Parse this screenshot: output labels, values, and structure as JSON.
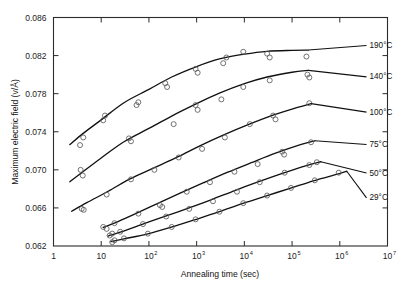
{
  "chart_data": {
    "type": "line",
    "title": "",
    "xlabel": "Annealing time (sec)",
    "ylabel": "Maximum electric field (v/Å)",
    "xscale": "log",
    "xlim": [
      1,
      10000000
    ],
    "ylim": [
      0.062,
      0.086
    ],
    "xticks": [
      1,
      10,
      100,
      1000,
      10000,
      100000,
      1000000,
      10000000
    ],
    "xtick_labels": [
      "1",
      "10",
      "10²",
      "10³",
      "10⁴",
      "10⁵",
      "10⁶",
      "10⁷"
    ],
    "xtick_mantissa": [
      "1",
      "10",
      "10",
      "10",
      "10",
      "10",
      "10",
      "10"
    ],
    "xtick_exponent": [
      "",
      "",
      "2",
      "3",
      "4",
      "5",
      "6",
      "7"
    ],
    "yticks": [
      0.062,
      0.066,
      0.07,
      0.074,
      0.078,
      0.082,
      0.086
    ],
    "ytick_labels": [
      "0.062",
      "0.066",
      "0.070",
      "0.074",
      "0.078",
      "0.082",
      "0.086"
    ],
    "grid": false,
    "legend_position": "inline-right-of-curve-ends",
    "marker": "open-circle",
    "line_color": "#111111",
    "marker_color": "#5a5a5a",
    "series": [
      {
        "name": "190°C",
        "label": "190°C",
        "label_x": 4000000,
        "label_y": 0.0828,
        "curve": [
          [
            2.2,
            0.07265
          ],
          [
            4.0,
            0.07375
          ],
          [
            10,
            0.07525
          ],
          [
            30,
            0.07705
          ],
          [
            100,
            0.07845
          ],
          [
            300,
            0.07975
          ],
          [
            1000,
            0.08085
          ],
          [
            3000,
            0.08165
          ],
          [
            10000,
            0.08215
          ],
          [
            30000,
            0.08245
          ],
          [
            100000,
            0.08255
          ],
          [
            220000,
            0.08258
          ]
        ],
        "points": [
          [
            3.6,
            0.0726
          ],
          [
            4.2,
            0.0734
          ],
          [
            11,
            0.0752
          ],
          [
            12,
            0.0757
          ],
          [
            55,
            0.0768
          ],
          [
            60,
            0.0771
          ],
          [
            220,
            0.0791
          ],
          [
            240,
            0.0787
          ],
          [
            950,
            0.0806
          ],
          [
            1050,
            0.0802
          ],
          [
            3600,
            0.0812
          ],
          [
            4200,
            0.0818
          ],
          [
            9500,
            0.0824
          ],
          [
            30000,
            0.0822
          ],
          [
            34000,
            0.0818
          ],
          [
            200000,
            0.0819
          ]
        ]
      },
      {
        "name": "140°C",
        "label": "140°C",
        "label_x": 4000000,
        "label_y": 0.0795,
        "curve": [
          [
            2.2,
            0.06875
          ],
          [
            4.0,
            0.06975
          ],
          [
            10,
            0.07125
          ],
          [
            30,
            0.07295
          ],
          [
            100,
            0.07435
          ],
          [
            300,
            0.07565
          ],
          [
            1000,
            0.07695
          ],
          [
            3000,
            0.07805
          ],
          [
            10000,
            0.07905
          ],
          [
            30000,
            0.07975
          ],
          [
            100000,
            0.08025
          ],
          [
            220000,
            0.08045
          ]
        ],
        "points": [
          [
            3.7,
            0.07
          ],
          [
            4.1,
            0.0694
          ],
          [
            38,
            0.0733
          ],
          [
            42,
            0.073
          ],
          [
            330,
            0.0748
          ],
          [
            950,
            0.0768
          ],
          [
            1050,
            0.0763
          ],
          [
            3300,
            0.0774
          ],
          [
            9500,
            0.0787
          ],
          [
            34000,
            0.0794
          ],
          [
            210000,
            0.08
          ],
          [
            230000,
            0.0797
          ]
        ]
      },
      {
        "name": "100°C",
        "label": "100°C",
        "label_x": 4000000,
        "label_y": 0.0758,
        "curve": [
          [
            2.4,
            0.06565
          ],
          [
            5.0,
            0.06655
          ],
          [
            14,
            0.06775
          ],
          [
            40,
            0.06905
          ],
          [
            120,
            0.07015
          ],
          [
            400,
            0.07135
          ],
          [
            1200,
            0.07255
          ],
          [
            3600,
            0.07365
          ],
          [
            12000,
            0.07475
          ],
          [
            40000,
            0.07575
          ],
          [
            130000,
            0.07655
          ],
          [
            250000,
            0.07695
          ]
        ],
        "points": [
          [
            3.9,
            0.0659
          ],
          [
            4.3,
            0.0658
          ],
          [
            13,
            0.0674
          ],
          [
            42,
            0.069
          ],
          [
            130,
            0.07
          ],
          [
            420,
            0.0713
          ],
          [
            1300,
            0.0722
          ],
          [
            3900,
            0.0734
          ],
          [
            13000,
            0.0748
          ],
          [
            40000,
            0.0757
          ],
          [
            45000,
            0.0753
          ],
          [
            230000,
            0.077
          ]
        ]
      },
      {
        "name": "75°C",
        "label": "75°C",
        "label_x": 4000000,
        "label_y": 0.0724,
        "curve": [
          [
            11,
            0.06395
          ],
          [
            20,
            0.06445
          ],
          [
            50,
            0.06535
          ],
          [
            150,
            0.06645
          ],
          [
            450,
            0.06755
          ],
          [
            1400,
            0.06865
          ],
          [
            4500,
            0.06975
          ],
          [
            14000,
            0.07075
          ],
          [
            45000,
            0.07175
          ],
          [
            150000,
            0.07265
          ],
          [
            300000,
            0.07305
          ]
        ],
        "points": [
          [
            11,
            0.064
          ],
          [
            13,
            0.0638
          ],
          [
            19,
            0.0644
          ],
          [
            60,
            0.0654
          ],
          [
            170,
            0.0663
          ],
          [
            190,
            0.0661
          ],
          [
            620,
            0.0677
          ],
          [
            1900,
            0.0687
          ],
          [
            6200,
            0.0698
          ],
          [
            19000,
            0.0706
          ],
          [
            62000,
            0.0719
          ],
          [
            68000,
            0.0716
          ],
          [
            250000,
            0.0729
          ]
        ]
      },
      {
        "name": "50°C",
        "label": "50°C",
        "label_x": 4000000,
        "label_y": 0.0694,
        "curve": [
          [
            14,
            0.06305
          ],
          [
            25,
            0.06345
          ],
          [
            70,
            0.06425
          ],
          [
            200,
            0.06505
          ],
          [
            650,
            0.06595
          ],
          [
            2000,
            0.06685
          ],
          [
            6500,
            0.06785
          ],
          [
            20000,
            0.06875
          ],
          [
            65000,
            0.06965
          ],
          [
            200000,
            0.07045
          ],
          [
            400000,
            0.07085
          ]
        ],
        "points": [
          [
            15,
            0.0631
          ],
          [
            17,
            0.0633
          ],
          [
            25,
            0.0635
          ],
          [
            75,
            0.0643
          ],
          [
            230,
            0.0651
          ],
          [
            700,
            0.0659
          ],
          [
            2200,
            0.0667
          ],
          [
            7000,
            0.0677
          ],
          [
            21000,
            0.0687
          ],
          [
            70000,
            0.0697
          ],
          [
            230000,
            0.0705
          ],
          [
            330000,
            0.0708
          ]
        ]
      },
      {
        "name": "29°C",
        "label": "29°C",
        "label_x": 4000000,
        "label_y": 0.0668,
        "curve": [
          [
            16,
            0.06245
          ],
          [
            30,
            0.06275
          ],
          [
            90,
            0.06325
          ],
          [
            280,
            0.06395
          ],
          [
            900,
            0.06475
          ],
          [
            2800,
            0.06555
          ],
          [
            9000,
            0.06645
          ],
          [
            28000,
            0.06725
          ],
          [
            90000,
            0.06805
          ],
          [
            280000,
            0.06885
          ],
          [
            900000,
            0.06955
          ],
          [
            1400000,
            0.06985
          ]
        ],
        "points": [
          [
            17,
            0.0624
          ],
          [
            19,
            0.0626
          ],
          [
            30,
            0.0628
          ],
          [
            95,
            0.0633
          ],
          [
            300,
            0.064
          ],
          [
            950,
            0.0648
          ],
          [
            3000,
            0.0656
          ],
          [
            9500,
            0.0665
          ],
          [
            30000,
            0.0673
          ],
          [
            95000,
            0.0681
          ],
          [
            300000,
            0.0689
          ],
          [
            950000,
            0.0697
          ]
        ]
      }
    ]
  }
}
